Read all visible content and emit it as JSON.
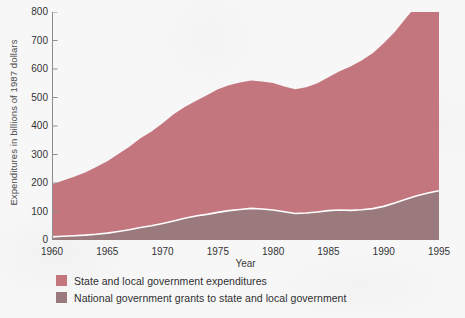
{
  "chart_data": {
    "type": "area",
    "stacked": true,
    "title": "",
    "xlabel": "Year",
    "ylabel": "Expenditures in billions of 1987 dollars",
    "xlim": [
      1960,
      1995
    ],
    "ylim": [
      0,
      800
    ],
    "ytick_step": 100,
    "xtick_major_step": 5,
    "xtick_minor_step": 1,
    "grid": false,
    "legend_position": "below-left",
    "x": [
      1960,
      1961,
      1962,
      1963,
      1964,
      1965,
      1966,
      1967,
      1968,
      1969,
      1970,
      1971,
      1972,
      1973,
      1974,
      1975,
      1976,
      1977,
      1978,
      1979,
      1980,
      1981,
      1982,
      1983,
      1984,
      1985,
      1986,
      1987,
      1988,
      1989,
      1990,
      1991,
      1992,
      1993,
      1994,
      1995
    ],
    "ytick_labels": [
      "0",
      "100",
      "200",
      "300",
      "400",
      "500",
      "600",
      "700",
      "800"
    ],
    "xtick_labels": [
      "1960",
      "1965",
      "1970",
      "1975",
      "1980",
      "1985",
      "1990",
      "1995"
    ],
    "series": [
      {
        "name": "National government grants to state and local government",
        "color": "#9a7a7c",
        "values": [
          11,
          13,
          15,
          17,
          20,
          24,
          30,
          36,
          44,
          50,
          58,
          67,
          76,
          84,
          90,
          97,
          103,
          107,
          111,
          109,
          105,
          99,
          93,
          95,
          98,
          103,
          105,
          104,
          106,
          110,
          118,
          130,
          143,
          155,
          165,
          173
        ]
      },
      {
        "name": "State and local government expenditures",
        "color": "#c4767e",
        "values": [
          184,
          196,
          207,
          220,
          236,
          252,
          272,
          291,
          313,
          331,
          352,
          374,
          391,
          404,
          418,
          432,
          440,
          446,
          449,
          447,
          446,
          440,
          436,
          441,
          452,
          468,
          487,
          505,
          524,
          545,
          572,
          600,
          635,
          670,
          710,
          748
        ]
      }
    ],
    "legend": [
      {
        "label": "State and local government expenditures",
        "color": "#c4767e"
      },
      {
        "label": "National government grants to state and local government",
        "color": "#9a7a7c"
      }
    ]
  },
  "axis": {
    "x_title": "Year"
  }
}
